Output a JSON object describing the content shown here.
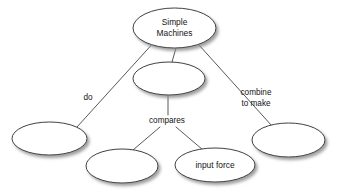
{
  "diagram": {
    "type": "concept-map",
    "background_color": "#ffffff",
    "node_fill": "#ffffff",
    "node_stroke": "#2b2b2b",
    "line_color": "#3a3a3a",
    "text_color": "#141414",
    "shadow_color": "#9a9a9a",
    "nodes": [
      {
        "id": "simple-machines",
        "label_line1": "Simple",
        "label_line2": "Machines",
        "cx": 174.5,
        "cy": 28,
        "rx": 41.5,
        "ry": 20,
        "empty": false
      },
      {
        "id": "middle-blank",
        "label_line1": "",
        "label_line2": "",
        "cx": 169,
        "cy": 78.5,
        "rx": 36,
        "ry": 16.5,
        "empty": true
      },
      {
        "id": "left-blank",
        "label_line1": "",
        "label_line2": "",
        "cx": 49.5,
        "cy": 138.5,
        "rx": 37.5,
        "ry": 16.5,
        "empty": true
      },
      {
        "id": "bottom-center-blank",
        "label_line1": "",
        "label_line2": "",
        "cx": 122,
        "cy": 166,
        "rx": 36,
        "ry": 17,
        "empty": true
      },
      {
        "id": "input-force",
        "label_line1": "input force",
        "label_line2": "",
        "cx": 215,
        "cy": 165,
        "rx": 40,
        "ry": 17,
        "empty": false
      },
      {
        "id": "right-blank",
        "label_line1": "",
        "label_line2": "",
        "cx": 288.5,
        "cy": 140,
        "rx": 36.5,
        "ry": 17,
        "empty": true
      }
    ],
    "edge_labels": [
      {
        "id": "do",
        "text_line1": "do",
        "text_line2": "",
        "x": 88,
        "y": 98
      },
      {
        "id": "combine-to-make",
        "text_line1": "combine",
        "text_line2": "to make",
        "x": 256,
        "y": 93
      },
      {
        "id": "compares",
        "text_line1": "compares",
        "text_line2": "",
        "x": 167,
        "y": 121
      }
    ],
    "connectors": [
      {
        "id": "root-to-left",
        "x1": 151,
        "y1": 45.5,
        "x2": 77,
        "y2": 127
      },
      {
        "id": "root-to-middle",
        "x1": 176,
        "y1": 48,
        "x2": 172,
        "y2": 62
      },
      {
        "id": "root-to-right",
        "x1": 199,
        "y1": 45,
        "x2": 272,
        "y2": 126
      },
      {
        "id": "middle-to-compares",
        "x1": 168,
        "y1": 95,
        "x2": 168,
        "y2": 115
      },
      {
        "id": "compares-to-bottom-center",
        "x1": 160,
        "y1": 127,
        "x2": 133,
        "y2": 150
      },
      {
        "id": "compares-to-input-force",
        "x1": 176,
        "y1": 127,
        "x2": 203,
        "y2": 150
      }
    ]
  }
}
